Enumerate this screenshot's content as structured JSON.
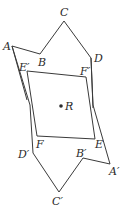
{
  "diagram": {
    "type": "geometric-rotation",
    "center": {
      "label": "R",
      "x": 61,
      "y": 105
    },
    "points": {
      "A": [
        12,
        46
      ],
      "B": [
        40,
        54
      ],
      "C": [
        64,
        21
      ],
      "D": [
        91,
        58
      ],
      "E_prime": [
        27,
        71
      ],
      "F_prime": [
        86,
        77
      ],
      "F": [
        37,
        136
      ],
      "E": [
        95,
        139
      ],
      "D_prime": [
        33,
        153
      ],
      "B_prime": [
        83,
        158
      ],
      "A_prime": [
        110,
        164
      ],
      "C_prime": [
        59,
        192
      ]
    },
    "labels": {
      "A": "A",
      "B": "B",
      "C": "C",
      "D": "D",
      "E_prime": "E′",
      "F_prime": "F′",
      "R": "R",
      "F": "F",
      "E": "E",
      "D_prime": "D′",
      "B_prime": "B′",
      "A_prime": "A′",
      "C_prime": "C′"
    },
    "stroke_color": "#3a3a3a"
  }
}
